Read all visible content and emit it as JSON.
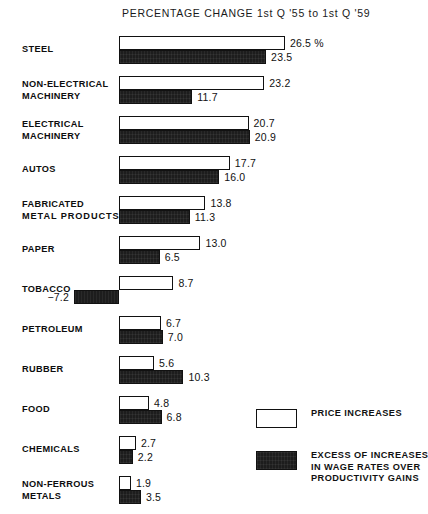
{
  "chart_data": {
    "type": "bar",
    "title": "PERCENTAGE CHANGE 1st Q '55 to 1st Q '59",
    "orientation": "horizontal",
    "xlabel": "",
    "ylabel": "",
    "grid": false,
    "xlim": [
      -7.2,
      26.5
    ],
    "legend_position": "bottom-right",
    "categories": [
      "STEEL",
      "NON-ELECTRICAL MACHINERY",
      "ELECTRICAL MACHINERY",
      "AUTOS",
      "FABRICATED METAL PRODUCTS",
      "PAPER",
      "TOBACCO",
      "PETROLEUM",
      "RUBBER",
      "FOOD",
      "CHEMICALS",
      "NON-FERROUS METALS"
    ],
    "series": [
      {
        "name": "PRICE INCREASES",
        "values": [
          26.5,
          23.2,
          20.7,
          17.7,
          13.8,
          13.0,
          8.7,
          6.7,
          5.6,
          4.8,
          2.7,
          1.9
        ]
      },
      {
        "name": "EXCESS OF INCREASES IN WAGE RATES OVER PRODUCTIVITY GAINS",
        "values": [
          23.5,
          11.7,
          20.9,
          16.0,
          11.3,
          6.5,
          -7.2,
          7.0,
          10.3,
          6.8,
          2.2,
          3.5
        ]
      }
    ],
    "value_labels": [
      {
        "top": "26.5 %",
        "bottom": "23.5"
      },
      {
        "top": "23.2",
        "bottom": "11.7"
      },
      {
        "top": "20.7",
        "bottom": "20.9"
      },
      {
        "top": "17.7",
        "bottom": "16.0"
      },
      {
        "top": "13.8",
        "bottom": "11.3"
      },
      {
        "top": "13.0",
        "bottom": "6.5"
      },
      {
        "top": "8.7",
        "bottom": "−7.2"
      },
      {
        "top": "6.7",
        "bottom": "7.0"
      },
      {
        "top": "5.6",
        "bottom": "10.3"
      },
      {
        "top": "4.8",
        "bottom": "6.8"
      },
      {
        "top": "2.7",
        "bottom": "2.2"
      },
      {
        "top": "1.9",
        "bottom": "3.5"
      }
    ]
  },
  "rows": [
    {
      "label_lines": [
        "STEEL"
      ]
    },
    {
      "label_lines": [
        "NON-ELECTRICAL",
        "MACHINERY"
      ]
    },
    {
      "label_lines": [
        "ELECTRICAL",
        "MACHINERY"
      ]
    },
    {
      "label_lines": [
        "AUTOS"
      ]
    },
    {
      "label_lines": [
        "FABRICATED",
        "METAL  PRODUCTS"
      ]
    },
    {
      "label_lines": [
        "PAPER"
      ]
    },
    {
      "label_lines": [
        "TOBACCO"
      ]
    },
    {
      "label_lines": [
        "PETROLEUM"
      ]
    },
    {
      "label_lines": [
        "RUBBER"
      ]
    },
    {
      "label_lines": [
        "FOOD"
      ]
    },
    {
      "label_lines": [
        "CHEMICALS"
      ]
    },
    {
      "label_lines": [
        "NON-FERROUS",
        "METALS"
      ]
    }
  ],
  "legend": {
    "items": [
      {
        "swatch": "light",
        "lines": [
          "PRICE INCREASES"
        ]
      },
      {
        "swatch": "dark",
        "lines": [
          "EXCESS OF INCREASES",
          "IN WAGE  RATES OVER",
          "PRODUCTIVITY GAINS"
        ]
      }
    ]
  },
  "colors": {
    "light_bar_fill": "#ffffff",
    "light_bar_border": "#111111",
    "dark_bar_fill": "#1d1d1d",
    "text": "#111111",
    "background": "#ffffff"
  }
}
